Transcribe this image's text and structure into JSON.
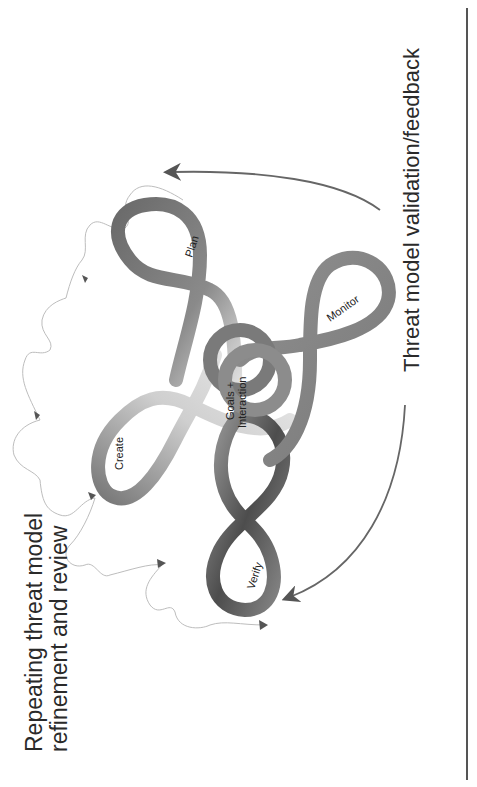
{
  "diagram": {
    "title_left": {
      "line1": "Repeating threat model",
      "line2": "refinement and review"
    },
    "title_right": "Threat model validation/feedback",
    "center_label": {
      "line1": "Goals +",
      "line2": "Interaction"
    },
    "loops": [
      {
        "id": "plan",
        "label": "Plan"
      },
      {
        "id": "create",
        "label": "Create"
      },
      {
        "id": "verify",
        "label": "Verify"
      },
      {
        "id": "monitor",
        "label": "Monitor"
      }
    ],
    "colors": {
      "background": "#ffffff",
      "loop_dark": "#5a5a5a",
      "loop_light": "#d8d8d8",
      "arrow": "#666666",
      "squiggle": "#bdbdbd",
      "text": "#2a2a2a"
    }
  }
}
